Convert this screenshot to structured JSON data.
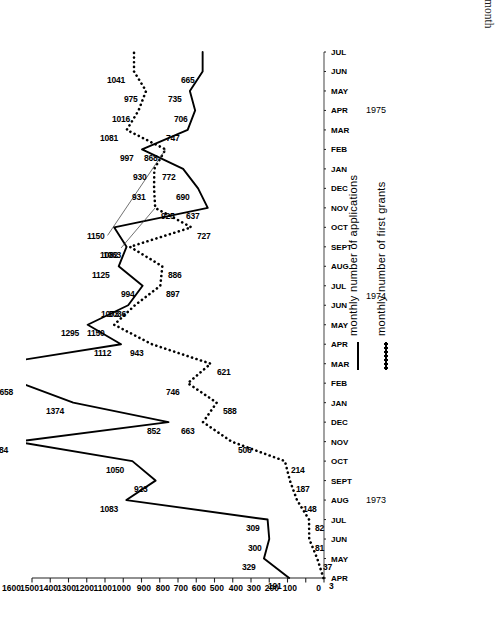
{
  "figure": {
    "label": "Figure 8",
    "caption": "The rate of growth in the Family Fund – the graph shows the number of applications received each month and the number of first grants made each month."
  },
  "legend": {
    "position": "inside-right",
    "items": [
      {
        "key": "solid",
        "label": "monthly number of applications"
      },
      {
        "key": "dotted",
        "label": "monthly number of first grants"
      }
    ]
  },
  "axis": {
    "y_ticks": [
      "0",
      "100",
      "200",
      "300",
      "400",
      "500",
      "600",
      "700",
      "800",
      "900",
      "1000",
      "1100",
      "1200",
      "1300",
      "1400",
      "1500",
      "1600"
    ],
    "years": [
      "1973",
      "1974",
      "1975"
    ]
  },
  "chart_data": {
    "type": "line",
    "title": "",
    "xlabel": "",
    "ylabel": "",
    "ylim": [
      0,
      1600
    ],
    "grid": false,
    "legend_position": "inside-right",
    "categories": [
      "APR",
      "MAY",
      "JUN",
      "JUL",
      "AUG",
      "SEPT",
      "OCT",
      "NOV",
      "DEC",
      "JAN",
      "FEB",
      "MAR",
      "APR",
      "MAY",
      "JUN",
      "JUL",
      "AUG",
      "SEPT",
      "OCT",
      "NOV",
      "DEC",
      "JAN",
      "FEB",
      "MAR",
      "APR",
      "MAY",
      "JUN",
      "JUL"
    ],
    "year_groups": [
      {
        "year": "1973",
        "start_index": 0,
        "count": 9
      },
      {
        "year": "1974",
        "start_index": 9,
        "count": 12
      },
      {
        "year": "1975",
        "start_index": 21,
        "count": 7
      }
    ],
    "series": [
      {
        "name": "monthly number of applications",
        "style": "solid",
        "values": [
          191,
          329,
          300,
          309,
          1083,
          923,
          1050,
          1684,
          852,
          1374,
          1658,
          1782,
          1112,
          1295,
          1073,
          994,
          1125,
          1082,
          1150,
          637,
          690,
          772,
          997,
          747,
          706,
          735,
          665,
          665
        ],
        "labels": [
          "191",
          "329",
          "300",
          "309",
          "1083",
          "923",
          "1050",
          "1684",
          "852",
          "1374",
          "1658",
          "1782",
          "1112",
          "1295",
          "1073",
          "994",
          "1125",
          "1082",
          "1150",
          "637",
          "690",
          "772",
          "997",
          "747",
          "706",
          "735",
          "665",
          ""
        ]
      },
      {
        "name": "monthly number of first grants",
        "style": "dotted",
        "values": [
          3,
          37,
          81,
          82,
          148,
          187,
          214,
          506,
          663,
          588,
          746,
          621,
          943,
          1150,
          1036,
          897,
          886,
          1063,
          727,
          925,
          931,
          930,
          868,
          1081,
          1016,
          975,
          1041,
          1041
        ],
        "labels": [
          "3",
          "37",
          "81",
          "82",
          "148",
          "187",
          "214",
          "506",
          "663",
          "588",
          "746",
          "621",
          "943",
          "1150",
          "1036",
          "897",
          "886",
          "1063",
          "727",
          "925",
          "931",
          "930",
          "868",
          "1081",
          "1016",
          "975",
          "1041",
          ""
        ]
      }
    ],
    "callout_labels": [
      {
        "text": "868",
        "note": "leader line to first-grants point"
      },
      {
        "text": "925",
        "note": "leader line to first-grants point"
      }
    ]
  }
}
